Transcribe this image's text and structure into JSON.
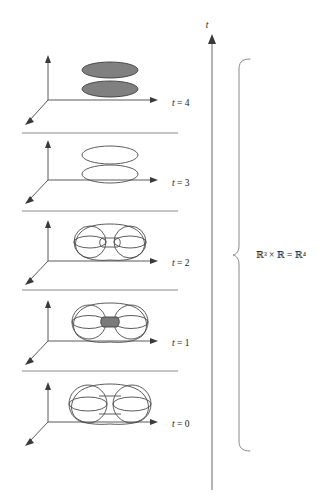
{
  "figure": {
    "background_color": "#ffffff",
    "width": 328,
    "height": 504
  },
  "colors": {
    "outline": "#4a4a4a",
    "axis": "#5a5a5a",
    "separator": "#8a8a8a",
    "fill_gray": "#808080",
    "neck_gray": "#7a7a7a",
    "text": "#1a1a1a"
  },
  "time_axis": {
    "label": "t",
    "x": 212,
    "top_y": 30,
    "bottom_y": 490
  },
  "brace": {
    "label": "ℝ³ × ℝ = ℝ⁴",
    "label_x": 268,
    "label_y": 253,
    "x": 238,
    "top_y": 58,
    "bottom_y": 452
  },
  "separators": [
    {
      "y": 133,
      "x1": 22,
      "x2": 178
    },
    {
      "y": 211,
      "x1": 22,
      "x2": 178
    },
    {
      "y": 290,
      "x1": 22,
      "x2": 178
    },
    {
      "y": 371,
      "x1": 22,
      "x2": 178
    }
  ],
  "slices": [
    {
      "id": "slice-t4",
      "label": "t = 4",
      "t_value": 4,
      "label_x": 172,
      "label_y": 106,
      "origin_x": 48,
      "origin_y": 100,
      "axis_up_y": 57,
      "axis_right_x": 158,
      "axis_diag_x": 26,
      "axis_diag_y": 124,
      "shape": "two-filled-disks",
      "description": "two flat shaded ellipses (disks) stacked vertically",
      "ellipses": [
        {
          "cx": 110,
          "cy": 70,
          "rx": 28,
          "ry": 8,
          "fill": "#808080"
        },
        {
          "cx": 110,
          "cy": 89,
          "rx": 28,
          "ry": 8,
          "fill": "#808080"
        }
      ]
    },
    {
      "id": "slice-t3",
      "label": "t = 3",
      "t_value": 3,
      "label_x": 172,
      "label_y": 186,
      "origin_x": 48,
      "origin_y": 180,
      "axis_up_y": 142,
      "axis_right_x": 158,
      "axis_diag_x": 26,
      "axis_diag_y": 203,
      "shape": "two-open-ellipses",
      "description": "two unfilled ellipse outlines stacked vertically",
      "ellipses": [
        {
          "cx": 110,
          "cy": 155,
          "rx": 28,
          "ry": 9,
          "fill": "none"
        },
        {
          "cx": 110,
          "cy": 174,
          "rx": 28,
          "ry": 9,
          "fill": "none"
        }
      ]
    },
    {
      "id": "slice-t2",
      "label": "t = 2",
      "t_value": 2,
      "label_x": 172,
      "label_y": 266,
      "origin_x": 48,
      "origin_y": 261,
      "axis_up_y": 221,
      "axis_right_x": 158,
      "axis_diag_x": 26,
      "axis_diag_y": 283,
      "shape": "two-spheres-thin-neck",
      "description": "two spheres joined by a thin open tube neck"
    },
    {
      "id": "slice-t1",
      "label": "t = 1",
      "t_value": 1,
      "label_x": 172,
      "label_y": 346,
      "origin_x": 48,
      "origin_y": 341,
      "axis_up_y": 301,
      "axis_right_x": 158,
      "axis_diag_x": 26,
      "axis_diag_y": 363,
      "shape": "two-spheres-filled-neck",
      "description": "two spheres joined by a short shaded neck"
    },
    {
      "id": "slice-t0",
      "label": "t = 0",
      "t_value": 0,
      "label_x": 172,
      "label_y": 427,
      "origin_x": 48,
      "origin_y": 422,
      "axis_up_y": 383,
      "axis_right_x": 158,
      "axis_diag_x": 26,
      "axis_diag_y": 444,
      "shape": "two-spheres-wide-neck",
      "description": "two large spheres joined by a wide neck"
    }
  ]
}
